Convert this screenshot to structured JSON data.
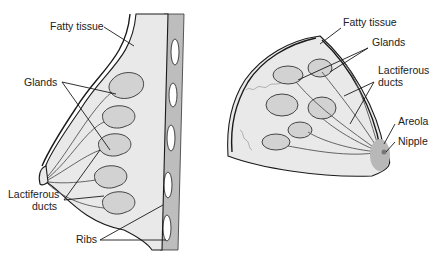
{
  "figure": {
    "left_view": {
      "title": "Sagittal section",
      "labels": {
        "fatty_tissue": "Fatty tissue",
        "glands": "Glands",
        "lactiferous_ducts_line1": "Lactiferous",
        "lactiferous_ducts_line2": "ducts",
        "ribs": "Ribs"
      }
    },
    "right_view": {
      "title": "Frontal cutaway",
      "labels": {
        "fatty_tissue": "Fatty tissue",
        "glands": "Glands",
        "lactiferous_ducts_line1": "Lactiferous",
        "lactiferous_ducts_line2": "ducts",
        "areola": "Areola",
        "nipple": "Nipple"
      }
    },
    "colors": {
      "tissue": "#e9e9e9",
      "gland": "#d2d2d2",
      "areola": "#b8b8b8",
      "outline": "#1a1a1a"
    }
  }
}
